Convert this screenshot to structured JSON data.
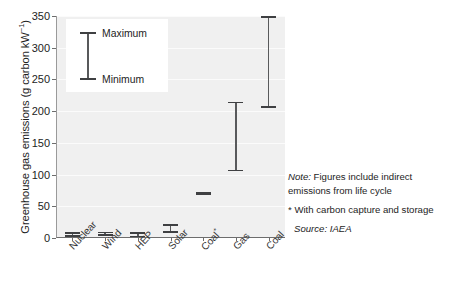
{
  "chart_data": {
    "type": "bar",
    "title": "",
    "subtitle": "",
    "xlabel": "",
    "ylabel": "Greenhouse gas emissions (g carbon kW",
    "ylabel_exponent": "−1",
    "ylabel_suffix": ")",
    "ylim": [
      0,
      350
    ],
    "yticks": [
      0,
      50,
      100,
      150,
      200,
      250,
      300,
      350
    ],
    "ytick_labels": [
      "0",
      "50",
      "100",
      "150",
      "200",
      "250",
      "300",
      "350"
    ],
    "grid": true,
    "grid_axis": "y",
    "legend_position": "inside-top-left",
    "categories": [
      "Nuclear",
      "Wind",
      "HEP",
      "Solar",
      "Coal*",
      "Gas",
      "Coal"
    ],
    "category_labels_rotated": true,
    "series": [
      {
        "name": "Minimum",
        "values": [
          2,
          3,
          1,
          8,
          67,
          105,
          205
        ]
      },
      {
        "name": "Maximum",
        "values": [
          9,
          10,
          9,
          22,
          72,
          215,
          350
        ]
      }
    ],
    "ranges": [
      {
        "category": "Nuclear",
        "min": 2,
        "max": 9
      },
      {
        "category": "Wind",
        "min": 3,
        "max": 10
      },
      {
        "category": "HEP",
        "min": 1,
        "max": 9
      },
      {
        "category": "Solar",
        "min": 8,
        "max": 22
      },
      {
        "category": "Coal*",
        "min": 67,
        "max": 72
      },
      {
        "category": "Gas",
        "min": 105,
        "max": 215
      },
      {
        "category": "Coal",
        "min": 205,
        "max": 350
      }
    ],
    "colors": {
      "plot_background": "#f0f0f0",
      "gridline": "#fbfbfb",
      "range_stem": "#58595b",
      "range_cap": "#3f4042",
      "axis": "#6d6d6d",
      "text": "#1d1d1d"
    }
  },
  "legend": {
    "max_label": "Maximum",
    "min_label": "Minimum"
  },
  "notes": {
    "note_prefix": "Note:",
    "note_line1": " Figures include indirect",
    "note_line2": "emissions from life cycle",
    "star_note": "* With carbon capture and storage",
    "source": "Source: IAEA"
  }
}
